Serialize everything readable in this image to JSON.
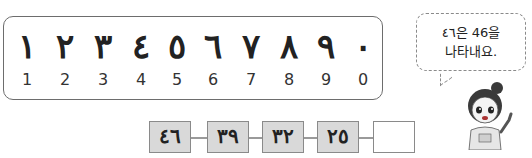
{
  "numerals": [
    {
      "arabic": "١",
      "western": "1"
    },
    {
      "arabic": "٢",
      "western": "2"
    },
    {
      "arabic": "٣",
      "western": "3"
    },
    {
      "arabic": "٤",
      "western": "4"
    },
    {
      "arabic": "٥",
      "western": "5"
    },
    {
      "arabic": "٦",
      "western": "6"
    },
    {
      "arabic": "٧",
      "western": "7"
    },
    {
      "arabic": "٨",
      "western": "8"
    },
    {
      "arabic": "٩",
      "western": "9"
    },
    {
      "arabic": "٠",
      "western": "0"
    }
  ],
  "sequence": [
    "٤٦",
    "٣٩",
    "٣٢",
    "٢٥",
    ""
  ],
  "bubble": {
    "line1": "٤٦은 46을",
    "line2": "나타내요."
  },
  "character": "girl-pointing-icon"
}
